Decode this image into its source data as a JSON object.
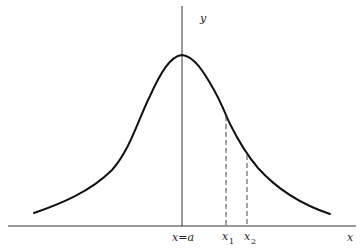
{
  "diagram": {
    "type": "bell-shaped curve with marked points",
    "axes": {
      "x_label": "x",
      "y_label": "y"
    },
    "labels": {
      "center": "x=a",
      "x1_main": "x",
      "x1_sub": "1",
      "x2_main": "x",
      "x2_sub": "2"
    },
    "colors": {
      "curve": "#111111",
      "axes": "#333333",
      "dashed": "#444444",
      "background": "#ffffff"
    }
  }
}
